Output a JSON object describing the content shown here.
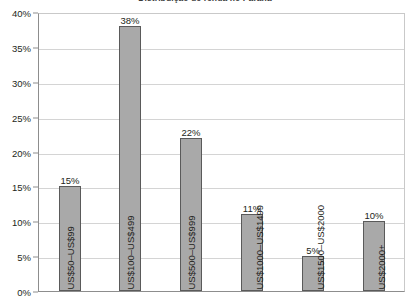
{
  "chart_data": {
    "type": "bar",
    "title": "Distribuição de renda no Paraná",
    "xlabel": "",
    "ylabel": "",
    "ylim": [
      0,
      40
    ],
    "ytick_labels": [
      "0%",
      "5%",
      "10%",
      "15%",
      "20%",
      "25%",
      "30%",
      "35%",
      "40%"
    ],
    "ytick_values": [
      0,
      5,
      10,
      15,
      20,
      25,
      30,
      35,
      40
    ],
    "grid": true,
    "legend": "none",
    "bar_color": "#a9a9a9",
    "bar_border_color": "#5a5a5a",
    "categories": [
      "US$50–US$99",
      "US$100–US$499",
      "US$500–US$999",
      "US$1000–US$1499",
      "US$1500–US$2000",
      "US$2000+"
    ],
    "values": [
      15,
      38,
      22,
      11,
      5,
      10
    ],
    "value_labels": [
      "15%",
      "38%",
      "22%",
      "11%",
      "5%",
      "10%"
    ]
  }
}
